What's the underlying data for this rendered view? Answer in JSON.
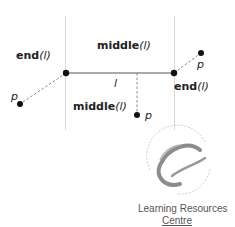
{
  "diagram": {
    "segment": {
      "label": "l",
      "left_end": [
        66,
        73
      ],
      "right_end": [
        174,
        73
      ]
    },
    "region_labels": {
      "end_left": {
        "fn": "end",
        "arg": "(l)"
      },
      "middle_top": {
        "fn": "middle",
        "arg": "(l)"
      },
      "middle_bottom": {
        "fn": "middle",
        "arg": "(l)"
      },
      "end_right": {
        "fn": "end",
        "arg": "(l)"
      }
    },
    "points": [
      {
        "name": "p",
        "region": "end-left",
        "position": [
          20,
          104
        ]
      },
      {
        "name": "p",
        "region": "middle",
        "position": [
          137,
          115
        ]
      },
      {
        "name": "p",
        "region": "end-right",
        "position": [
          201,
          53
        ]
      }
    ],
    "colors": {
      "line": "#555555",
      "boundary": "#dddddd",
      "point": "#111111",
      "dashed": "#888888"
    }
  },
  "watermark": {
    "ring_top": "UNIVERSITY OF GLAMORGAN",
    "ring_bottom": "PRIFYSGOL MORGANNWG",
    "line1": "Learning Resources",
    "line2": "Centre"
  }
}
